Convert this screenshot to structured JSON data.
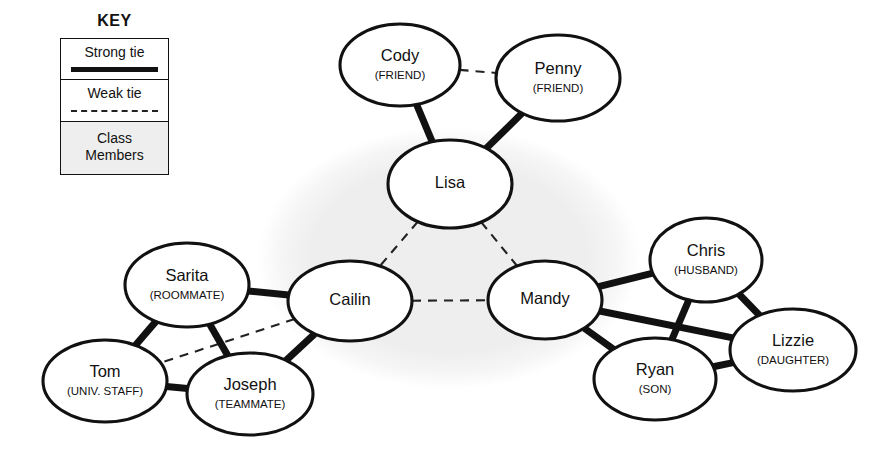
{
  "legend": {
    "title": "KEY",
    "rows": [
      {
        "label": "Strong tie",
        "sample": "solid-thick-line"
      },
      {
        "label": "Weak tie",
        "sample": "dashed-line"
      },
      {
        "label_line1": "Class",
        "label_line2": "Members",
        "sample": "gray-fill-swatch"
      }
    ]
  },
  "colors": {
    "ink": "#111111",
    "class_region_fill": "#eeeeee",
    "node_fill": "#ffffff",
    "background": "#ffffff"
  },
  "chart_data": {
    "type": "network-diagram",
    "title": "",
    "class_region_label": "Class Members",
    "nodes": [
      {
        "id": "cody",
        "name": "Cody",
        "role": "(FRIEND)",
        "cx": 400,
        "cy": 65,
        "rx": 60,
        "ry": 41,
        "class_member": false
      },
      {
        "id": "penny",
        "name": "Penny",
        "role": "(FRIEND)",
        "cx": 558,
        "cy": 78,
        "rx": 62,
        "ry": 43,
        "class_member": false
      },
      {
        "id": "lisa",
        "name": "Lisa",
        "role": "",
        "cx": 450,
        "cy": 184,
        "rx": 62,
        "ry": 44,
        "class_member": true
      },
      {
        "id": "cailin",
        "name": "Cailin",
        "role": "",
        "cx": 350,
        "cy": 301,
        "rx": 62,
        "ry": 40,
        "class_member": true
      },
      {
        "id": "mandy",
        "name": "Mandy",
        "role": "",
        "cx": 545,
        "cy": 300,
        "rx": 57,
        "ry": 39,
        "class_member": true
      },
      {
        "id": "sarita",
        "name": "Sarita",
        "role": "(ROOMMATE)",
        "cx": 187,
        "cy": 285,
        "rx": 62,
        "ry": 42,
        "class_member": false
      },
      {
        "id": "tom",
        "name": "Tom",
        "role": "(UNIV. STAFF)",
        "cx": 105,
        "cy": 381,
        "rx": 62,
        "ry": 41,
        "class_member": false
      },
      {
        "id": "joseph",
        "name": "Joseph",
        "role": "(TEAMMATE)",
        "cx": 250,
        "cy": 394,
        "rx": 63,
        "ry": 41,
        "class_member": false
      },
      {
        "id": "chris",
        "name": "Chris",
        "role": "(HUSBAND)",
        "cx": 706,
        "cy": 260,
        "rx": 56,
        "ry": 42,
        "class_member": false
      },
      {
        "id": "lizzie",
        "name": "Lizzie",
        "role": "(DAUGHTER)",
        "cx": 793,
        "cy": 350,
        "rx": 63,
        "ry": 41,
        "class_member": false
      },
      {
        "id": "ryan",
        "name": "Ryan",
        "role": "(SON)",
        "cx": 655,
        "cy": 379,
        "rx": 61,
        "ry": 41,
        "class_member": false
      }
    ],
    "edges": [
      {
        "source": "cody",
        "target": "penny",
        "tie": "weak"
      },
      {
        "source": "cody",
        "target": "lisa",
        "tie": "strong"
      },
      {
        "source": "penny",
        "target": "lisa",
        "tie": "strong"
      },
      {
        "source": "lisa",
        "target": "cailin",
        "tie": "weak"
      },
      {
        "source": "lisa",
        "target": "mandy",
        "tie": "weak"
      },
      {
        "source": "cailin",
        "target": "mandy",
        "tie": "weak"
      },
      {
        "source": "cailin",
        "target": "sarita",
        "tie": "strong"
      },
      {
        "source": "cailin",
        "target": "joseph",
        "tie": "strong"
      },
      {
        "source": "cailin",
        "target": "tom",
        "tie": "weak"
      },
      {
        "source": "sarita",
        "target": "tom",
        "tie": "strong"
      },
      {
        "source": "sarita",
        "target": "joseph",
        "tie": "strong"
      },
      {
        "source": "tom",
        "target": "joseph",
        "tie": "strong"
      },
      {
        "source": "mandy",
        "target": "chris",
        "tie": "strong"
      },
      {
        "source": "mandy",
        "target": "lizzie",
        "tie": "strong"
      },
      {
        "source": "mandy",
        "target": "ryan",
        "tie": "strong"
      },
      {
        "source": "chris",
        "target": "lizzie",
        "tie": "strong"
      },
      {
        "source": "chris",
        "target": "ryan",
        "tie": "strong"
      },
      {
        "source": "ryan",
        "target": "lizzie",
        "tie": "strong"
      }
    ],
    "class_region": {
      "cx": 449,
      "cy": 258,
      "rx": 191,
      "ry": 131
    },
    "legend_entries": [
      "Strong tie",
      "Weak tie",
      "Class Members"
    ]
  }
}
